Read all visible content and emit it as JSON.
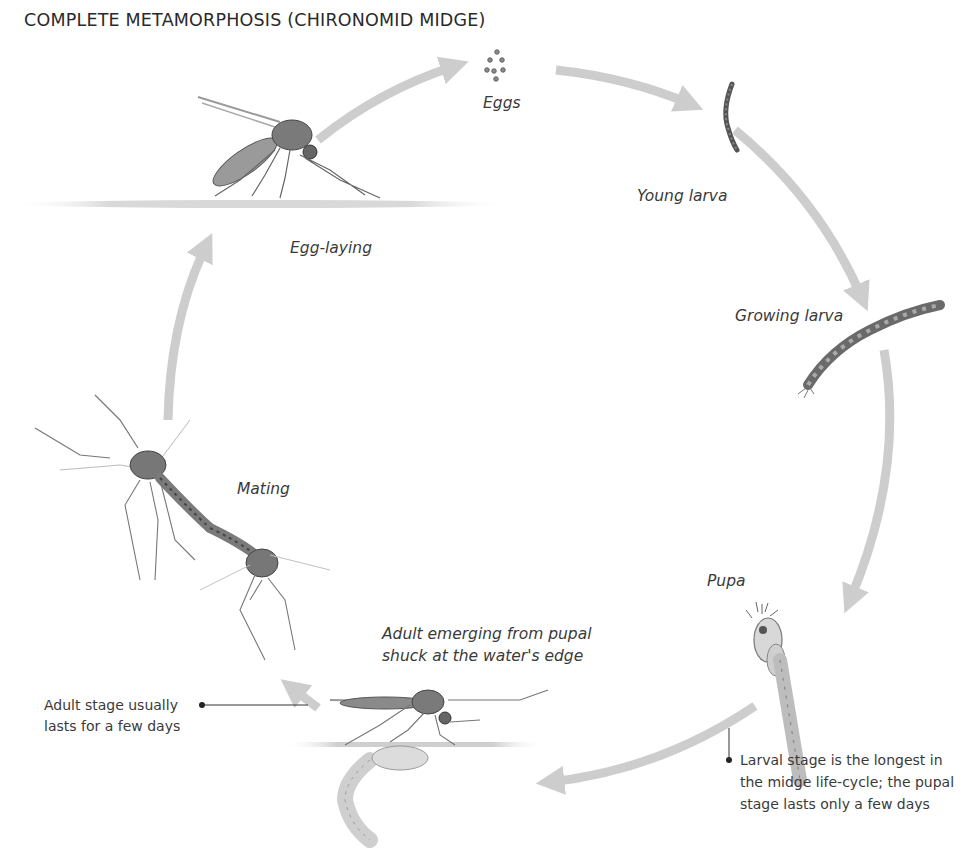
{
  "diagram": {
    "title": "COMPLETE METAMORPHOSIS (CHIRONOMID MIDGE)",
    "arrow_color": "#cdcdcd",
    "stages": [
      {
        "id": "eggs",
        "label": "Eggs",
        "icon": "eggs-icon"
      },
      {
        "id": "young-larva",
        "label": "Young larva",
        "icon": "young-larva-icon"
      },
      {
        "id": "growing-larva",
        "label": "Growing larva",
        "icon": "growing-larva-icon"
      },
      {
        "id": "pupa",
        "label": "Pupa",
        "icon": "pupa-icon"
      },
      {
        "id": "emerging",
        "label_line1": "Adult emerging from pupal",
        "label_line2": "shuck at the water's edge",
        "icon": "emerging-adult-icon"
      },
      {
        "id": "mating",
        "label": "Mating",
        "icon": "mating-midges-icon"
      },
      {
        "id": "egg-laying",
        "label": "Egg-laying",
        "icon": "egg-laying-midge-icon"
      }
    ],
    "notes": {
      "adult": {
        "line1": "Adult stage usually",
        "line2": "lasts for a few days"
      },
      "larval": {
        "line1": "Larval stage is the longest in",
        "line2": "the midge life-cycle; the pupal",
        "line3": "stage lasts only a few days"
      }
    }
  }
}
